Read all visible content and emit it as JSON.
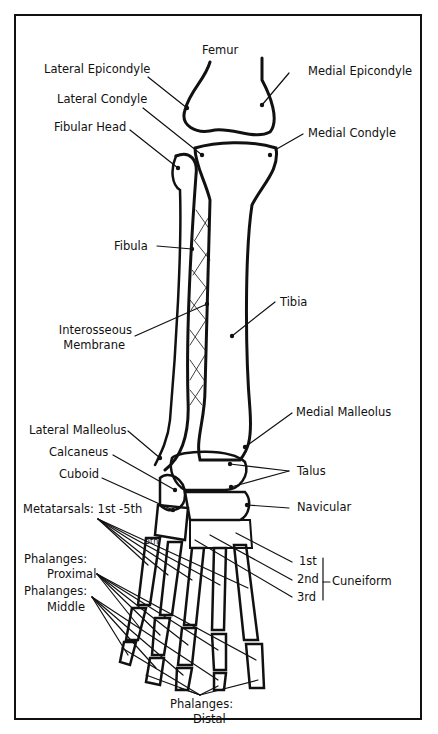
{
  "diagram": {
    "labels": {
      "femur": "Femur",
      "lateral_epicondyle": "Lateral Epicondyle",
      "medial_epicondyle": "Medial Epicondyle",
      "lateral_condyle": "Lateral Condyle",
      "medial_condyle": "Medial Condyle",
      "fibular_head": "Fibular Head",
      "fibula": "Fibula",
      "tibia": "Tibia",
      "interosseous_1": "Interosseous",
      "interosseous_2": "Membrane",
      "lateral_malleolus": "Lateral Malleolus",
      "medial_malleolus": "Medial Malleolus",
      "calcaneus": "Calcaneus",
      "talus": "Talus",
      "cuboid": "Cuboid",
      "navicular": "Navicular",
      "metatarsals": "Metatarsals: 1st -5th",
      "phalanges_proximal_1": "Phalanges:",
      "phalanges_proximal_2": "Proximal",
      "phalanges_middle_1": "Phalanges:",
      "phalanges_middle_2": "Middle",
      "cuneiform_1st": "1st",
      "cuneiform_2nd": "2nd",
      "cuneiform_3rd": "3rd",
      "cuneiform": "Cuneiform",
      "phalanges_distal_1": "Phalanges:",
      "phalanges_distal_2": "Distal",
      "fifth_mark": "5th"
    }
  }
}
